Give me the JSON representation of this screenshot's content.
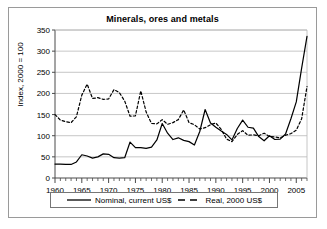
{
  "chart_data": {
    "type": "line",
    "title": "Minerals, ores and metals",
    "xlabel": "",
    "ylabel": "Index, 2000 = 100",
    "xlim": [
      1960,
      2007
    ],
    "ylim": [
      0,
      350
    ],
    "ytick_labels": [
      "0",
      "50",
      "100",
      "150",
      "200",
      "250",
      "300",
      "350"
    ],
    "yticks": [
      0,
      50,
      100,
      150,
      200,
      250,
      300,
      350
    ],
    "xtick_labels": [
      "1960",
      "1965",
      "1970",
      "1975",
      "1980",
      "1985",
      "1990",
      "1995",
      "2000",
      "2005"
    ],
    "xticks": [
      1960,
      1965,
      1970,
      1975,
      1980,
      1985,
      1990,
      1995,
      2000,
      2005
    ],
    "minor_xtick_interval": 1,
    "grid": "horizontal",
    "legend_position": "bottom",
    "x": [
      1960,
      1961,
      1962,
      1963,
      1964,
      1965,
      1966,
      1967,
      1968,
      1969,
      1970,
      1971,
      1972,
      1973,
      1974,
      1975,
      1976,
      1977,
      1978,
      1979,
      1980,
      1981,
      1982,
      1983,
      1984,
      1985,
      1986,
      1987,
      1988,
      1989,
      1990,
      1991,
      1992,
      1993,
      1994,
      1995,
      1996,
      1997,
      1998,
      1999,
      2000,
      2001,
      2002,
      2003,
      2004,
      2005,
      2006,
      2007
    ],
    "series": [
      {
        "name": "Nominal, current US$",
        "style": "solid",
        "color": "#000000",
        "values": [
          33,
          33,
          32,
          32,
          38,
          55,
          52,
          47,
          50,
          57,
          56,
          48,
          47,
          48,
          85,
          72,
          72,
          70,
          73,
          90,
          129,
          106,
          91,
          95,
          89,
          86,
          78,
          110,
          162,
          130,
          120,
          111,
          103,
          90,
          117,
          137,
          120,
          118,
          98,
          88,
          100,
          91,
          92,
          104,
          140,
          180,
          260,
          335
        ]
      },
      {
        "name": "Real, 2000 US$",
        "style": "dashed",
        "color": "#000000",
        "values": [
          150,
          137,
          133,
          131,
          145,
          196,
          222,
          188,
          190,
          186,
          187,
          209,
          202,
          182,
          146,
          147,
          206,
          156,
          129,
          128,
          138,
          127,
          131,
          138,
          161,
          131,
          126,
          116,
          119,
          126,
          130,
          115,
          92,
          86,
          103,
          112,
          101,
          102,
          100,
          106,
          98,
          97,
          95,
          101,
          105,
          113,
          140,
          216
        ]
      }
    ]
  },
  "legend": {
    "items": [
      {
        "label": "Nominal, current US$",
        "style": "solid"
      },
      {
        "label": "Real, 2000 US$",
        "style": "dashed"
      }
    ]
  }
}
